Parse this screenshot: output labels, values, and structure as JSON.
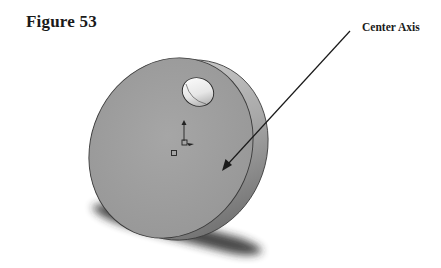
{
  "figure": {
    "title": "Figure 53",
    "callout": {
      "label": "Center Axis",
      "arrow_start": [
        350,
        31
      ],
      "arrow_end": [
        222,
        170
      ]
    },
    "part": {
      "name": "disk-with-hole",
      "face_color": "#9c9c9c",
      "rim_color": "#7a7a7a",
      "hole_color": "#ffffff",
      "shadow_color": "#2a2a2a"
    }
  }
}
